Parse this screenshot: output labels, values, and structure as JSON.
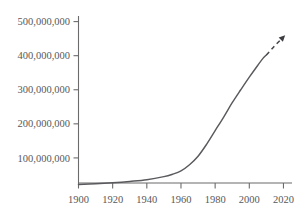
{
  "chart_data": {
    "type": "line",
    "title": "",
    "subtitle": "",
    "xlabel": "",
    "ylabel": "",
    "xlim": [
      1900,
      2025
    ],
    "ylim": [
      0,
      520000000
    ],
    "grid": false,
    "legend": null,
    "x_ticks": [
      "1900",
      "1920",
      "1940",
      "1960",
      "1980",
      "2000",
      "2020"
    ],
    "x_tick_values": [
      1900,
      1920,
      1940,
      1960,
      1980,
      2000,
      2020
    ],
    "y_ticks": [
      "100,000,000",
      "200,000,000",
      "300,000,000",
      "400,000,000",
      "500,000,000"
    ],
    "y_tick_values": [
      100000000,
      200000000,
      300000000,
      400000000,
      500000000
    ],
    "series": [
      {
        "name": "observed",
        "style": "solid",
        "x": [
          1900,
          1910,
          1920,
          1930,
          1940,
          1950,
          1955,
          1960,
          1965,
          1970,
          1975,
          1980,
          1985,
          1990,
          1995,
          2000,
          2005,
          2008,
          2010
        ],
        "values": [
          22000000,
          24000000,
          27000000,
          31000000,
          36000000,
          45000000,
          52000000,
          62000000,
          80000000,
          105000000,
          140000000,
          180000000,
          220000000,
          262000000,
          300000000,
          337000000,
          372000000,
          392000000,
          402000000
        ]
      },
      {
        "name": "projected",
        "style": "dashed",
        "arrow": true,
        "x": [
          2010,
          2014,
          2018,
          2021
        ],
        "values": [
          402000000,
          424000000,
          445000000,
          460000000
        ]
      }
    ],
    "annotations": [
      {
        "name": "projection-arrow",
        "kind": "arrowhead",
        "x": 2021,
        "y": 460000000
      }
    ]
  },
  "axes": {
    "y_axis_name": "y-axis",
    "x_axis_name": "x-axis"
  }
}
